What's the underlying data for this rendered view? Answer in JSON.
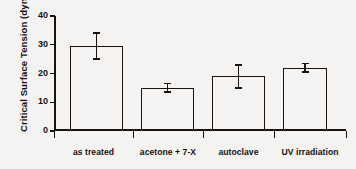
{
  "chart_data": {
    "type": "bar",
    "title": "",
    "xlabel": "",
    "ylabel": "Critical Surface Tension (dynes/cm2)",
    "ylabel_main": "Critical Surface Tension (dynes/cm",
    "ylabel_sup": "2",
    "ylabel_close": ")",
    "categories": [
      "as treated",
      "acetone + 7-X",
      "autoclave",
      "UV irradiation"
    ],
    "values": [
      29.5,
      15.0,
      19.0,
      22.0
    ],
    "errors_upper": [
      4.5,
      1.5,
      4.0,
      1.5
    ],
    "errors_lower": [
      4.5,
      1.5,
      4.0,
      1.5
    ],
    "ylim": [
      0,
      40
    ],
    "yticks": [
      0,
      10,
      20,
      30,
      40
    ],
    "ytick_labels": [
      "0",
      "10",
      "20",
      "30",
      "40"
    ],
    "grid": false,
    "legend": false,
    "bar_fill": "#ffffff",
    "bar_edge_color": "#15120f",
    "axis_color": "#15120f",
    "background": "#f4f3f1"
  }
}
